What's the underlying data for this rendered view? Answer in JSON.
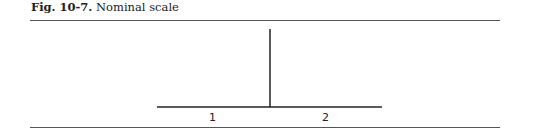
{
  "figure": {
    "label": "Fig. 10-7.",
    "title": "Nominal scale"
  },
  "diagram": {
    "categories": [
      "1",
      "2"
    ],
    "colors": {
      "line": "#222222",
      "rule": "#555555"
    }
  }
}
